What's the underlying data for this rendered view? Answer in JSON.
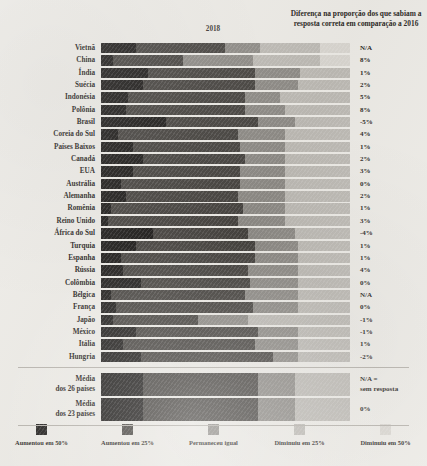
{
  "header": {
    "note": "Diferença na proporção dos que sabiam a resposta correta em comparação a 2016",
    "year_label": "2018"
  },
  "legend": {
    "items": [
      {
        "label": "Aumentou em 50%",
        "color": "#1c1a18",
        "key": "aumentou_50"
      },
      {
        "label": "Aumentou em 25%",
        "color": "#46433f",
        "key": "aumentou_25"
      },
      {
        "label": "Permaneceu igual",
        "color": "#8d8a85",
        "key": "permaneceu_igual"
      },
      {
        "label": "Diminuiu em 25%",
        "color": "#bcb9b3",
        "key": "diminuiu_25"
      },
      {
        "label": "Diminuiu em 50%",
        "color": "#d8d5cf",
        "key": "diminuiu_50"
      }
    ]
  },
  "footnote": "N/A = sem resposta",
  "chart_data": {
    "type": "bar",
    "title": "2018",
    "subtitle": "Diferença na proporção dos que sabiam a resposta correta em comparação a 2016",
    "orientation": "horizontal",
    "stacked": true,
    "normalized": true,
    "xlabel": "",
    "ylabel": "",
    "xlim": [
      0,
      100
    ],
    "grid": false,
    "legend_position": "bottom",
    "value_column_header": "Diferença na proporção dos que sabiam a resposta correta em comparação a 2016",
    "series": [
      {
        "name": "Aumentou em 50%",
        "color": "#1c1a18"
      },
      {
        "name": "Aumentou em 25%",
        "color": "#46433f"
      },
      {
        "name": "Permaneceu igual",
        "color": "#8d8a85"
      },
      {
        "name": "Diminuiu em 25%",
        "color": "#bcb9b3"
      },
      {
        "name": "Diminuiu em 50%",
        "color": "#d8d5cf"
      }
    ],
    "categories": [
      "Vietnã",
      "China",
      "Índia",
      "Suécia",
      "Indonésia",
      "Polônia",
      "Brasil",
      "Coreia do Sul",
      "Países Baixos",
      "Canadá",
      "EUA",
      "Austrália",
      "Alemanha",
      "Romênia",
      "Reino Unido",
      "África do Sul",
      "Turquia",
      "Espanha",
      "Rússia",
      "Colômbia",
      "Bélgica",
      "França",
      "Japão",
      "México",
      "Itália",
      "Hungria"
    ],
    "rows": [
      {
        "label": "Vietnã",
        "values": [
          14,
          36,
          14,
          24,
          12
        ],
        "diff": "N/A"
      },
      {
        "label": "China",
        "values": [
          5,
          28,
          28,
          27,
          12
        ],
        "diff": "8%"
      },
      {
        "label": "Índia",
        "values": [
          19,
          43,
          18,
          20,
          0
        ],
        "diff": "1%"
      },
      {
        "label": "Suécia",
        "values": [
          17,
          45,
          17,
          21,
          0
        ],
        "diff": "2%"
      },
      {
        "label": "Indonésia",
        "values": [
          11,
          47,
          14,
          28,
          0
        ],
        "diff": "5%"
      },
      {
        "label": "Polônia",
        "values": [
          10,
          48,
          16,
          26,
          0
        ],
        "diff": "8%"
      },
      {
        "label": "Brasil",
        "values": [
          26,
          37,
          15,
          22,
          0
        ],
        "diff": "-5%"
      },
      {
        "label": "Coreia do Sul",
        "values": [
          7,
          48,
          19,
          26,
          0
        ],
        "diff": "4%"
      },
      {
        "label": "Países Baixos",
        "values": [
          13,
          43,
          18,
          26,
          0
        ],
        "diff": "1%"
      },
      {
        "label": "Canadá",
        "values": [
          17,
          41,
          16,
          26,
          0
        ],
        "diff": "2%"
      },
      {
        "label": "EUA",
        "values": [
          13,
          43,
          18,
          26,
          0
        ],
        "diff": "3%"
      },
      {
        "label": "Austrália",
        "values": [
          8,
          48,
          18,
          26,
          0
        ],
        "diff": "0%"
      },
      {
        "label": "Alemanha",
        "values": [
          10,
          45,
          19,
          26,
          0
        ],
        "diff": "2%"
      },
      {
        "label": "Romênia",
        "values": [
          4,
          53,
          17,
          26,
          0
        ],
        "diff": "1%"
      },
      {
        "label": "Reino Unido",
        "values": [
          3,
          52,
          19,
          26,
          0
        ],
        "diff": "3%"
      },
      {
        "label": "África do Sul",
        "values": [
          21,
          38,
          19,
          22,
          0
        ],
        "diff": "-4%"
      },
      {
        "label": "Turquia",
        "values": [
          14,
          48,
          17,
          21,
          0
        ],
        "diff": "1%"
      },
      {
        "label": "Espanha",
        "values": [
          8,
          54,
          17,
          21,
          0
        ],
        "diff": "1%"
      },
      {
        "label": "Rússia",
        "values": [
          9,
          50,
          20,
          21,
          0
        ],
        "diff": "4%"
      },
      {
        "label": "Colômbia",
        "values": [
          16,
          44,
          19,
          21,
          0
        ],
        "diff": "0%"
      },
      {
        "label": "Bélgica",
        "values": [
          4,
          54,
          21,
          21,
          0
        ],
        "diff": "N/A"
      },
      {
        "label": "França",
        "values": [
          6,
          55,
          18,
          21,
          0
        ],
        "diff": "0%"
      },
      {
        "label": "Japão",
        "values": [
          5,
          34,
          20,
          41,
          0
        ],
        "diff": "-1%"
      },
      {
        "label": "México",
        "values": [
          14,
          49,
          16,
          21,
          0
        ],
        "diff": "-1%"
      },
      {
        "label": "Itália",
        "values": [
          9,
          53,
          17,
          21,
          0
        ],
        "diff": "1%"
      },
      {
        "label": "Hungria",
        "values": [
          16,
          53,
          10,
          21,
          0
        ],
        "diff": "-2%"
      }
    ],
    "averages": [
      {
        "label_line1": "Média",
        "label_line2": "dos 26 países",
        "values": [
          17,
          46,
          15,
          22,
          0
        ],
        "diff_line1": "N/A =",
        "diff_line2": "sem resposta"
      },
      {
        "label_line1": "Média",
        "label_line2": "dos 23 países",
        "values": [
          17,
          46,
          15,
          22,
          0
        ],
        "diff_line1": "0%",
        "diff_line2": ""
      }
    ]
  }
}
